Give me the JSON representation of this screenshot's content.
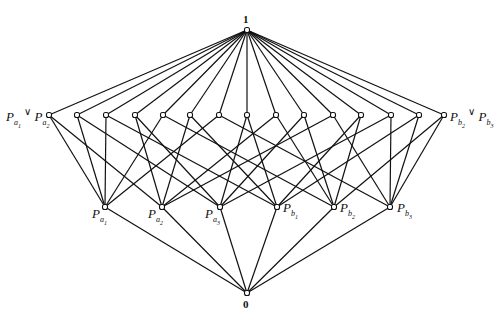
{
  "figure": {
    "stroke_color": "#111111",
    "node_fill": "#ffffff",
    "top": {
      "id": "1",
      "label": "1",
      "x": 247,
      "y": 30
    },
    "bottom": {
      "id": "0",
      "label": "0",
      "x": 247,
      "y": 293
    },
    "atoms": [
      {
        "id": "a1",
        "label": "P",
        "sub": "a",
        "subsub": "1",
        "x": 105,
        "y": 207
      },
      {
        "id": "a2",
        "label": "P",
        "sub": "a",
        "subsub": "2",
        "x": 162,
        "y": 207
      },
      {
        "id": "a3",
        "label": "P",
        "sub": "a",
        "subsub": "3",
        "x": 220,
        "y": 207
      },
      {
        "id": "b1",
        "label": "P",
        "sub": "b",
        "subsub": "1",
        "x": 277,
        "y": 207
      },
      {
        "id": "b2",
        "label": "P",
        "sub": "b",
        "subsub": "2",
        "x": 334,
        "y": 207
      },
      {
        "id": "b3",
        "label": "P",
        "sub": "b",
        "subsub": "3",
        "x": 390,
        "y": 207
      }
    ],
    "joins": [
      {
        "x": 49,
        "y": 115,
        "pair": [
          "a1",
          "a2"
        ],
        "label": "P_a1 ∨ P_a2"
      },
      {
        "x": 77,
        "y": 115,
        "pair": [
          "a1",
          "a3"
        ]
      },
      {
        "x": 106,
        "y": 115,
        "pair": [
          "a1",
          "b1"
        ]
      },
      {
        "x": 135,
        "y": 115,
        "pair": [
          "a2",
          "a3"
        ]
      },
      {
        "x": 163,
        "y": 115,
        "pair": [
          "a1",
          "b2"
        ]
      },
      {
        "x": 190,
        "y": 115,
        "pair": [
          "a2",
          "b1"
        ]
      },
      {
        "x": 219,
        "y": 115,
        "pair": [
          "a1",
          "b3"
        ]
      },
      {
        "x": 247,
        "y": 115,
        "pair": [
          "a3",
          "b1"
        ]
      },
      {
        "x": 276,
        "y": 115,
        "pair": [
          "a2",
          "b2"
        ]
      },
      {
        "x": 304,
        "y": 115,
        "pair": [
          "a3",
          "b2"
        ]
      },
      {
        "x": 333,
        "y": 115,
        "pair": [
          "a2",
          "b3"
        ]
      },
      {
        "x": 361,
        "y": 115,
        "pair": [
          "b1",
          "b2"
        ]
      },
      {
        "x": 391,
        "y": 115,
        "pair": [
          "a3",
          "b3"
        ]
      },
      {
        "x": 419,
        "y": 115,
        "pair": [
          "b1",
          "b3"
        ]
      },
      {
        "x": 444,
        "y": 115,
        "pair": [
          "b2",
          "b3"
        ],
        "label": "P_b2 ∨ P_b3"
      }
    ],
    "labels": {
      "top": "1",
      "bottom": "0",
      "left_join": {
        "p1": "P",
        "s1": "a",
        "ss1": "1",
        "op": "∨",
        "p2": "P",
        "s2": "a",
        "ss2": "2"
      },
      "right_join": {
        "p1": "P",
        "s1": "b",
        "ss1": "2",
        "op": "∨",
        "p2": "P",
        "s2": "b",
        "ss2": "3"
      }
    }
  }
}
